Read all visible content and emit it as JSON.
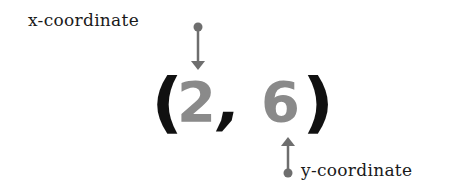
{
  "labels": {
    "x": "x-coordinate",
    "y": "y-coordinate"
  },
  "coordinate": {
    "open": "(",
    "x_value": "2",
    "separator": ",",
    "y_value": "6",
    "close": ")"
  },
  "colors": {
    "value": "#8a8a8a",
    "paren": "#111111",
    "arrow": "#6e6e6e",
    "text": "#1a1a1a"
  }
}
